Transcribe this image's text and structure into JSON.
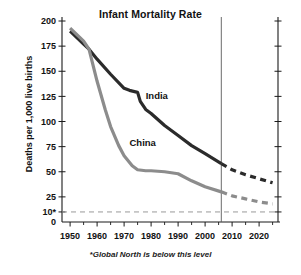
{
  "chart_data": {
    "type": "line",
    "title": "Infant Mortality Rate",
    "xlabel": "",
    "ylabel": "Deaths per 1,000 live births",
    "xlim": [
      1947,
      2027
    ],
    "ylim": [
      0,
      200
    ],
    "grid": false,
    "legend_position": "inline-annotations",
    "x_ticks": [
      1950,
      1960,
      1970,
      1980,
      1990,
      2000,
      2010,
      2020
    ],
    "x_tick_labels": [
      "1950",
      "1960",
      "1970",
      "1980",
      "1990",
      "2000",
      "2010",
      "2020"
    ],
    "x_minor_ticks": [
      1955,
      1965,
      1975,
      1985,
      1995,
      2005,
      2015,
      2025
    ],
    "y_ticks": [
      0,
      10,
      25,
      50,
      75,
      100,
      125,
      150,
      175,
      200
    ],
    "y_tick_labels": [
      "0",
      "10*",
      "25",
      "50",
      "75",
      "100",
      "125",
      "150",
      "175",
      "200"
    ],
    "threshold": {
      "value": 10,
      "label": "10*",
      "note": "Global North is below this level"
    },
    "projection_start_year": 2006,
    "series": [
      {
        "name": "India",
        "color": "#2b2b2b",
        "label": "India",
        "label_year": 1978,
        "label_value": 122,
        "x": [
          1950,
          1955,
          1957,
          1960,
          1965,
          1970,
          1972,
          1975,
          1976,
          1978,
          1980,
          1985,
          1990,
          1995,
          2000,
          2006
        ],
        "values": [
          190,
          177,
          172,
          162,
          147,
          133,
          131,
          129,
          120,
          112,
          108,
          96,
          86,
          76,
          68,
          58
        ],
        "projection_x": [
          2006,
          2010,
          2015,
          2020,
          2025
        ],
        "projection_values": [
          58,
          52,
          47,
          43,
          39
        ]
      },
      {
        "name": "China",
        "color": "#8c8c8c",
        "label": "China",
        "label_year": 1972,
        "label_value": 76,
        "x": [
          1950,
          1955,
          1957,
          1960,
          1963,
          1965,
          1968,
          1970,
          1973,
          1975,
          1978,
          1980,
          1985,
          1990,
          1995,
          2000,
          2006
        ],
        "values": [
          193,
          180,
          172,
          140,
          112,
          95,
          76,
          66,
          56,
          52,
          51,
          51,
          50,
          48,
          41,
          35,
          30
        ],
        "projection_x": [
          2006,
          2010,
          2015,
          2020,
          2025
        ],
        "projection_values": [
          30,
          26,
          23,
          20,
          18
        ]
      }
    ]
  },
  "footnote": "*Global North is below this level"
}
